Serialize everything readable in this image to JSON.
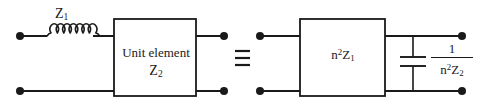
{
  "figure": {
    "type": "circuit-equivalence-diagram",
    "ink_color": "#1a1a1a",
    "background_color": "#ffffff",
    "width": 482,
    "height": 108
  },
  "left_circuit": {
    "series_label": "Z",
    "series_label_sub": "1",
    "inductor": {
      "name": "inductor-z1",
      "loops": 7
    },
    "box": {
      "title": "Unit element",
      "impedance": "Z",
      "impedance_sub": "2"
    },
    "terminals": 4
  },
  "equivalence": {
    "symbol": "≡",
    "name": "identical-to-symbol"
  },
  "right_circuit": {
    "box": {
      "coefficient": "n",
      "exponent": "2",
      "impedance": "Z",
      "impedance_sub": "1"
    },
    "shunt": {
      "component": "capacitor",
      "numerator": "1",
      "denominator_coefficient": "n",
      "denominator_exponent": "2",
      "denominator_impedance": "Z",
      "denominator_impedance_sub": "2"
    },
    "terminals": 4
  }
}
